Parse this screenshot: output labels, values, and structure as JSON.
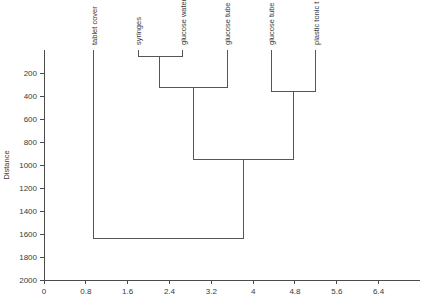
{
  "chart_data": {
    "type": "line",
    "chart_kind": "dendrogram",
    "title": "",
    "subtitle": "",
    "xlabel": "",
    "ylabel": "Distance",
    "ylim": [
      0,
      2000
    ],
    "xlim": [
      0,
      7.0
    ],
    "grid": false,
    "legend": null,
    "y_ticks": [
      200,
      400,
      600,
      800,
      1000,
      1200,
      1400,
      1600,
      1800,
      2000
    ],
    "y_tick_labels": [
      "200",
      "400",
      "600",
      "800",
      "1000",
      "1200",
      "1400",
      "1600",
      "1800",
      "2000"
    ],
    "x_ticks": [
      0,
      0.8,
      1.6,
      2.4,
      3.2,
      4,
      4.8,
      5.6,
      6.4
    ],
    "x_tick_labels": [
      "0",
      "0.8",
      "1.6",
      "2.4",
      "3.2",
      "4",
      "4.8",
      "5.6",
      "6.4"
    ],
    "y_axis_inverted": true,
    "leaves": [
      {
        "label": "tablet cover",
        "x": 0.95
      },
      {
        "label": "syringes",
        "x": 1.8
      },
      {
        "label": "glucose water",
        "x": 2.65
      },
      {
        "label": "glucose tube",
        "x": 3.5
      },
      {
        "label": "glucose tube",
        "x": 4.35
      },
      {
        "label": "plastic tonic t",
        "x": 5.2
      }
    ],
    "merges": [
      {
        "id": "m1",
        "left": "syringes",
        "right": "glucose water",
        "height": 60,
        "x": 2.2
      },
      {
        "id": "m2",
        "left": "m1",
        "right": "glucose tube",
        "height": 330,
        "x": 2.85
      },
      {
        "id": "m3",
        "left": "glucose tube",
        "right": "plastic tonic t",
        "height": 365,
        "x": 4.78
      },
      {
        "id": "m4",
        "left": "m2",
        "right": "m3",
        "height": 950,
        "x": 3.82
      },
      {
        "id": "m5",
        "left": "tablet cover",
        "right": "m4",
        "height": 1640,
        "x": 2.38
      }
    ]
  }
}
